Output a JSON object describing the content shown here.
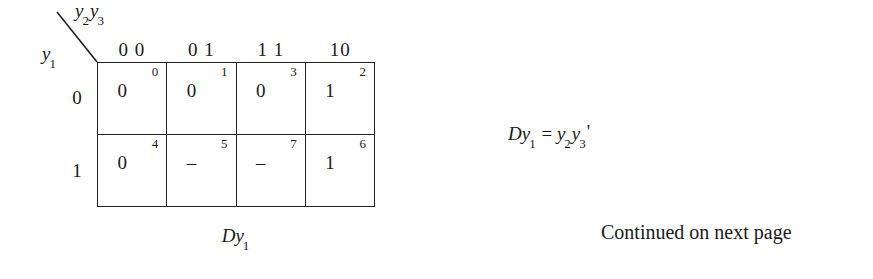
{
  "figure": {
    "row_variable": "y",
    "row_variable_sub": "1",
    "col_variable_1": "y",
    "col_variable_1_sub": "2",
    "col_variable_2": "y",
    "col_variable_2_sub": "3",
    "column_headers": [
      "0 0",
      "0 1",
      "1 1",
      "10"
    ],
    "row_headers": [
      "0",
      "1"
    ],
    "caption_main": "D",
    "caption_var": "y",
    "caption_sub": "1",
    "cells": [
      [
        {
          "index": "0",
          "value": "0"
        },
        {
          "index": "1",
          "value": "0"
        },
        {
          "index": "3",
          "value": "0"
        },
        {
          "index": "2",
          "value": "1"
        }
      ],
      [
        {
          "index": "4",
          "value": "0"
        },
        {
          "index": "5",
          "value": "–"
        },
        {
          "index": "7",
          "value": "–"
        },
        {
          "index": "6",
          "value": "1"
        }
      ]
    ]
  },
  "equation": {
    "lhs_d": "D",
    "lhs_var": "y",
    "lhs_sub": "1",
    "operator": "=",
    "rhs_var1": "y",
    "rhs_sub1": "2",
    "rhs_var2": "y",
    "rhs_sub2": "3",
    "rhs_prime": "'"
  },
  "note": {
    "text": "Continued on next page"
  },
  "colors": {
    "ink": "#1a1a1a",
    "rule": "#222222",
    "background": "#ffffff"
  }
}
